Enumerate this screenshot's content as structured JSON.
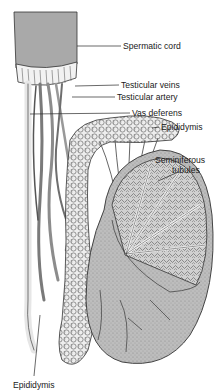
{
  "figure": {
    "labels": [
      {
        "id": "spermatic-cord",
        "text": "Spermatic cord",
        "x": 123,
        "y": 41
      },
      {
        "id": "testicular-veins",
        "text": "Testicular veins",
        "x": 121,
        "y": 80
      },
      {
        "id": "testicular-artery",
        "text": "Testicular artery",
        "x": 117,
        "y": 92
      },
      {
        "id": "vas-deferens",
        "text": "Vas deferens",
        "x": 132,
        "y": 108
      },
      {
        "id": "epididymis-top",
        "text": "Epididymis",
        "x": 161,
        "y": 122
      },
      {
        "id": "seminiferous-tubules-1",
        "text": "Seminiferous",
        "x": 155,
        "y": 155
      },
      {
        "id": "seminiferous-tubules-2",
        "text": "tubules",
        "x": 172,
        "y": 165
      },
      {
        "id": "epididymis-bottom",
        "text": "Epididymis",
        "x": 13,
        "y": 380
      }
    ],
    "colors": {
      "line": "#2a2a2a",
      "cord_sheath": "#a9a9a9",
      "testis_shade": "#b5b5b5",
      "tubule_fill": "#d6d6d6",
      "background": "#ffffff"
    }
  }
}
